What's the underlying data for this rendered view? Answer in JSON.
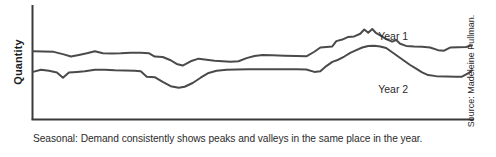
{
  "figure": {
    "y_axis_label": "Quantity",
    "caption": "Seasonal: Demand consistently shows peaks and valleys in the same place in the year.",
    "source": "Source: Madeleine Pullman.",
    "line_color": "#4a4a4a",
    "axis_color": "#3a3a3a",
    "background": "#ffffff"
  },
  "chart_data": {
    "type": "line",
    "title": "",
    "subtitle": "",
    "xlabel": "",
    "ylabel": "Quantity",
    "annotation": "Seasonal: Demand consistently shows peaks and valleys in the same place in the year.",
    "source": "Source: Madeleine Pullman.",
    "grid": false,
    "legend": "inline-labels",
    "axis": {
      "x_axis_visible": true,
      "y_axis_visible": true,
      "x_ticks": [],
      "y_ticks": [],
      "xlim": [
        0,
        100
      ],
      "ylim": [
        0,
        100
      ],
      "note": "Axes are unlabeled; values are relative units read off the plotted curves."
    },
    "series": [
      {
        "name": "Year 1",
        "label": "Year 1",
        "color": "#4a4a4a",
        "label_position": {
          "x": 86.5,
          "y": 74
        },
        "points": [
          [
            0.0,
            63.0
          ],
          [
            2.6,
            62.8
          ],
          [
            5.2,
            62.4
          ],
          [
            7.7,
            60.0
          ],
          [
            9.5,
            58.0
          ],
          [
            11.5,
            59.5
          ],
          [
            13.5,
            61.0
          ],
          [
            15.5,
            63.0
          ],
          [
            17.5,
            61.0
          ],
          [
            19.8,
            60.8
          ],
          [
            22.0,
            61.0
          ],
          [
            24.5,
            61.5
          ],
          [
            27.0,
            61.5
          ],
          [
            29.0,
            61.2
          ],
          [
            30.5,
            58.0
          ],
          [
            32.5,
            57.5
          ],
          [
            34.5,
            54.5
          ],
          [
            36.0,
            51.0
          ],
          [
            37.5,
            49.5
          ],
          [
            39.5,
            53.5
          ],
          [
            41.5,
            56.0
          ],
          [
            43.5,
            55.0
          ],
          [
            45.5,
            54.0
          ],
          [
            47.5,
            53.5
          ],
          [
            49.5,
            53.0
          ],
          [
            51.5,
            53.5
          ],
          [
            53.5,
            56.5
          ],
          [
            55.5,
            58.5
          ],
          [
            57.5,
            59.5
          ],
          [
            60.0,
            59.2
          ],
          [
            63.0,
            58.8
          ],
          [
            66.0,
            58.5
          ],
          [
            68.5,
            58.2
          ],
          [
            70.5,
            62.5
          ],
          [
            72.0,
            66.5
          ],
          [
            73.5,
            67.0
          ],
          [
            75.0,
            67.5
          ],
          [
            76.0,
            72.5
          ],
          [
            77.5,
            74.0
          ],
          [
            79.0,
            76.5
          ],
          [
            80.5,
            77.0
          ],
          [
            82.0,
            79.5
          ],
          [
            83.0,
            83.5
          ],
          [
            84.0,
            80.5
          ],
          [
            85.0,
            84.0
          ],
          [
            86.0,
            80.0
          ],
          [
            87.0,
            78.0
          ],
          [
            88.5,
            74.5
          ],
          [
            90.0,
            72.0
          ],
          [
            91.0,
            73.5
          ],
          [
            92.0,
            70.0
          ],
          [
            93.5,
            68.0
          ],
          [
            95.5,
            67.5
          ],
          [
            97.5,
            67.2
          ],
          [
            99.5,
            66.5
          ],
          [
            101.5,
            64.0
          ],
          [
            103.0,
            63.5
          ],
          [
            104.5,
            66.5
          ],
          [
            106.5,
            66.8
          ],
          [
            108.5,
            67.0
          ],
          [
            110.0,
            68.5
          ]
        ]
      },
      {
        "name": "Year 2",
        "label": "Year 2",
        "color": "#4a4a4a",
        "label_position": {
          "x": 86.5,
          "y": 24
        },
        "points": [
          [
            0.0,
            43.5
          ],
          [
            2.0,
            45.5
          ],
          [
            4.0,
            44.5
          ],
          [
            6.0,
            43.0
          ],
          [
            7.5,
            38.0
          ],
          [
            9.0,
            43.0
          ],
          [
            11.0,
            43.5
          ],
          [
            13.0,
            44.0
          ],
          [
            15.5,
            45.5
          ],
          [
            18.0,
            45.5
          ],
          [
            20.5,
            45.0
          ],
          [
            23.0,
            44.8
          ],
          [
            25.5,
            44.5
          ],
          [
            27.0,
            44.0
          ],
          [
            28.5,
            39.0
          ],
          [
            30.5,
            38.5
          ],
          [
            32.5,
            34.0
          ],
          [
            34.5,
            30.0
          ],
          [
            36.5,
            28.5
          ],
          [
            38.0,
            29.5
          ],
          [
            40.0,
            33.0
          ],
          [
            42.0,
            38.0
          ],
          [
            44.0,
            42.5
          ],
          [
            46.0,
            44.5
          ],
          [
            48.5,
            45.5
          ],
          [
            51.0,
            45.8
          ],
          [
            54.0,
            45.9
          ],
          [
            58.0,
            46.0
          ],
          [
            62.0,
            46.0
          ],
          [
            66.0,
            46.0
          ],
          [
            68.5,
            45.8
          ],
          [
            70.5,
            43.5
          ],
          [
            72.0,
            44.0
          ],
          [
            73.5,
            49.0
          ],
          [
            75.0,
            53.0
          ],
          [
            76.5,
            55.0
          ],
          [
            78.0,
            58.0
          ],
          [
            79.5,
            61.5
          ],
          [
            81.0,
            64.0
          ],
          [
            82.5,
            66.5
          ],
          [
            84.0,
            68.0
          ],
          [
            85.5,
            68.2
          ],
          [
            87.0,
            67.5
          ],
          [
            88.5,
            66.0
          ],
          [
            90.0,
            62.0
          ],
          [
            91.5,
            58.0
          ],
          [
            93.0,
            54.0
          ],
          [
            94.5,
            50.0
          ],
          [
            96.0,
            46.5
          ],
          [
            97.5,
            43.0
          ],
          [
            99.0,
            40.5
          ],
          [
            101.0,
            39.5
          ],
          [
            103.5,
            39.2
          ],
          [
            106.0,
            39.0
          ],
          [
            107.5,
            39.0
          ],
          [
            109.0,
            42.0
          ],
          [
            110.0,
            45.0
          ]
        ]
      }
    ]
  }
}
